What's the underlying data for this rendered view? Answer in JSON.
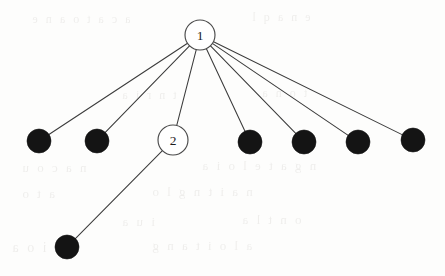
{
  "figure": {
    "type": "graph-diagram",
    "background_color": "#fdfdfc",
    "edge_color": "#3b3b3b",
    "filled_node_color": "#141414",
    "open_node_fill": "#ffffff",
    "open_node_stroke": "#4a4a4a",
    "nodes": [
      {
        "id": "n1",
        "label": "1",
        "style": "open",
        "cx": 200,
        "cy": 35,
        "r": 15
      },
      {
        "id": "n2",
        "label": "2",
        "style": "open",
        "cx": 173,
        "cy": 140,
        "r": 15
      },
      {
        "id": "l1",
        "label": "",
        "style": "filled",
        "cx": 39,
        "cy": 141,
        "r": 12
      },
      {
        "id": "l2",
        "label": "",
        "style": "filled",
        "cx": 97,
        "cy": 141,
        "r": 12
      },
      {
        "id": "l3",
        "label": "",
        "style": "filled",
        "cx": 250,
        "cy": 142,
        "r": 12
      },
      {
        "id": "l4",
        "label": "",
        "style": "filled",
        "cx": 304,
        "cy": 142,
        "r": 12
      },
      {
        "id": "l5",
        "label": "",
        "style": "filled",
        "cx": 358,
        "cy": 142,
        "r": 12
      },
      {
        "id": "l6",
        "label": "",
        "style": "filled",
        "cx": 413,
        "cy": 140,
        "r": 12
      },
      {
        "id": "l7",
        "label": "",
        "style": "filled",
        "cx": 67,
        "cy": 247,
        "r": 12
      }
    ],
    "edges": [
      {
        "from": "n1",
        "to": "l1"
      },
      {
        "from": "n1",
        "to": "l2"
      },
      {
        "from": "n1",
        "to": "n2"
      },
      {
        "from": "n1",
        "to": "l3"
      },
      {
        "from": "n1",
        "to": "l4"
      },
      {
        "from": "n1",
        "to": "l5"
      },
      {
        "from": "n1",
        "to": "l6"
      },
      {
        "from": "n2",
        "to": "l7"
      }
    ],
    "ghost_text": [
      {
        "text": "a c a t o a n e",
        "x": 30,
        "y": 12,
        "size": 12
      },
      {
        "text": "e n a q l",
        "x": 250,
        "y": 10,
        "size": 12
      },
      {
        "text": "t n r i  a",
        "x": 120,
        "y": 88,
        "size": 12
      },
      {
        "text": "t  o n a",
        "x": 260,
        "y": 86,
        "size": 12
      },
      {
        "text": "n a  c o u",
        "x": 20,
        "y": 160,
        "size": 13
      },
      {
        "text": "n g a t e l o i a",
        "x": 200,
        "y": 158,
        "size": 13
      },
      {
        "text": "a t  o",
        "x": 20,
        "y": 186,
        "size": 13
      },
      {
        "text": "n a i  t  n g  l  o",
        "x": 150,
        "y": 184,
        "size": 13
      },
      {
        "text": "i u a",
        "x": 120,
        "y": 214,
        "size": 13
      },
      {
        "text": "o n  t  l a",
        "x": 240,
        "y": 212,
        "size": 13
      },
      {
        "text": "i  o  a",
        "x": 10,
        "y": 240,
        "size": 14
      },
      {
        "text": "a l o i  t a n g",
        "x": 150,
        "y": 238,
        "size": 13
      }
    ]
  }
}
